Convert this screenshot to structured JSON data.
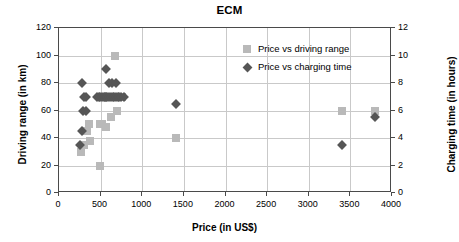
{
  "chart_data": {
    "type": "scatter",
    "title": "ECM",
    "xlabel": "Price (in US$)",
    "ylabel": "Driving range (in km)",
    "y2label": "Charging time (in hours)",
    "xlim": [
      0,
      4000
    ],
    "ylim": [
      0,
      120
    ],
    "y2lim": [
      0,
      12
    ],
    "xticks": [
      0,
      500,
      1000,
      1500,
      2000,
      2500,
      3000,
      3500,
      4000
    ],
    "yticks": [
      0,
      20,
      40,
      60,
      80,
      100,
      120
    ],
    "y2ticks": [
      0,
      2,
      4,
      6,
      8,
      10,
      12
    ],
    "grid": true,
    "legend_position": "top-right",
    "series": [
      {
        "name": "Price vs driving range",
        "axis": "left",
        "marker": "square",
        "color": "#b9b9b9",
        "points": [
          [
            265,
            30
          ],
          [
            300,
            35
          ],
          [
            340,
            45
          ],
          [
            355,
            50
          ],
          [
            370,
            38
          ],
          [
            490,
            20
          ],
          [
            490,
            50
          ],
          [
            520,
            50
          ],
          [
            560,
            48
          ],
          [
            620,
            55
          ],
          [
            670,
            100
          ],
          [
            700,
            60
          ],
          [
            760,
            70
          ],
          [
            1400,
            40
          ],
          [
            3400,
            60
          ],
          [
            3800,
            60
          ]
        ]
      },
      {
        "name": "Price vs charging time",
        "axis": "right",
        "marker": "diamond",
        "color": "#565656",
        "points": [
          [
            250,
            3.5
          ],
          [
            280,
            4.5
          ],
          [
            280,
            8.0
          ],
          [
            290,
            6.0
          ],
          [
            300,
            7.0
          ],
          [
            320,
            6.0
          ],
          [
            330,
            7.0
          ],
          [
            455,
            7.0
          ],
          [
            475,
            7.0
          ],
          [
            495,
            7.0
          ],
          [
            515,
            7.0
          ],
          [
            535,
            7.0
          ],
          [
            550,
            7.0
          ],
          [
            560,
            9.0
          ],
          [
            565,
            7.0
          ],
          [
            580,
            7.0
          ],
          [
            600,
            8.0
          ],
          [
            600,
            7.0
          ],
          [
            620,
            7.0
          ],
          [
            640,
            8.0
          ],
          [
            645,
            7.0
          ],
          [
            665,
            7.0
          ],
          [
            680,
            8.0
          ],
          [
            685,
            7.0
          ],
          [
            705,
            7.0
          ],
          [
            725,
            7.0
          ],
          [
            750,
            7.0
          ],
          [
            775,
            7.0
          ],
          [
            1400,
            6.5
          ],
          [
            3400,
            3.5
          ],
          [
            3800,
            5.5
          ]
        ]
      }
    ]
  },
  "legend": {
    "items": [
      {
        "label": "Price vs driving range",
        "marker": "square"
      },
      {
        "label": "Price vs charging time",
        "marker": "diamond"
      }
    ]
  }
}
